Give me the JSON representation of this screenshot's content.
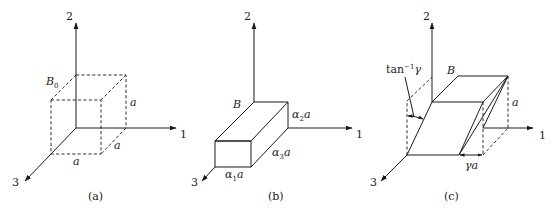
{
  "panels": [
    {
      "id": "a",
      "caption": "(a)",
      "body_label": "B",
      "body_sub": "0",
      "axis_labels": {
        "x1": "1",
        "x2": "2",
        "x3": "3"
      },
      "edge_labels": {
        "vertical": "a",
        "depth": "a",
        "width": "a"
      },
      "description": "Reference cube B0 of side a, drawn dashed"
    },
    {
      "id": "b",
      "caption": "(b)",
      "body_label": "B",
      "axis_labels": {
        "x1": "1",
        "x2": "2",
        "x3": "3"
      },
      "edge_labels": {
        "height": {
          "sym": "α",
          "sub": "2",
          "tail": "a"
        },
        "depth": {
          "sym": "α",
          "sub": "3",
          "tail": "a"
        },
        "width": {
          "sym": "α",
          "sub": "1",
          "tail": "a"
        }
      },
      "description": "Stretched box with edges α1a, α2a, α3a"
    },
    {
      "id": "c",
      "caption": "(c)",
      "body_label": "B",
      "axis_labels": {
        "x1": "1",
        "x2": "2",
        "x3": "3"
      },
      "edge_labels": {
        "height": "a",
        "shear": "γa"
      },
      "angle_label": {
        "base": "tan",
        "sup": "−1",
        "tail": "γ"
      },
      "description": "Simple shear of cube by amount γ"
    }
  ]
}
